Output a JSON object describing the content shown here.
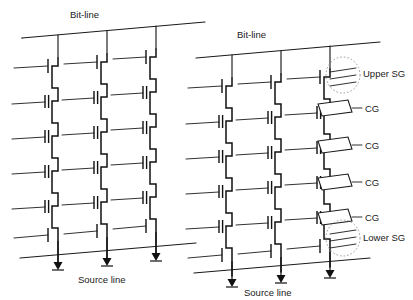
{
  "figure": {
    "colors": {
      "line": "#1a1a1a",
      "background": "#ffffff",
      "annotation_ellipse": "#9a9a9a"
    }
  },
  "labels": {
    "bitline_left": "Bit-line",
    "bitline_right": "Bit-line",
    "sourceline_left": "Source line",
    "sourceline_right": "Source line",
    "upper_sg": "Upper SG",
    "lower_sg": "Lower SG",
    "cg_1": "CG",
    "cg_2": "CG",
    "cg_3": "CG",
    "cg_4": "CG"
  },
  "structure": {
    "blocks": 2,
    "strings_per_block": 3,
    "rows_per_string": 6,
    "row_types": [
      "select-gate-upper",
      "control-gate-cell",
      "control-gate-cell",
      "control-gate-cell",
      "control-gate-cell",
      "select-gate-lower"
    ],
    "word_lines": 6,
    "ground_symbols_per_block": 3
  },
  "geometry": {
    "block_left_origin_x": 38,
    "block_right_origin_x": 212,
    "string_pitch_x": 67,
    "row_pitch_y": 35,
    "first_row_y": 62,
    "perspective_dx": 29,
    "perspective_dy": -9
  }
}
